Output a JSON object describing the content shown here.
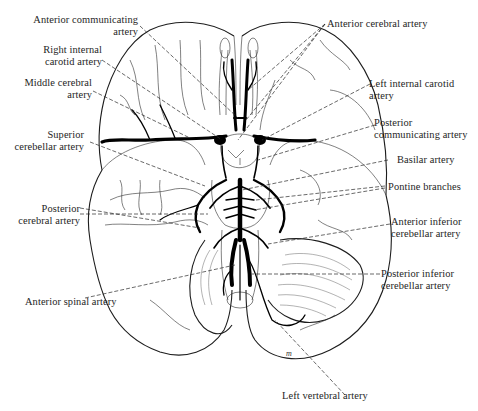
{
  "figure": {
    "artist_mark": "m"
  },
  "labels": {
    "anterior_communicating": {
      "lines": [
        "Anterior communicating",
        "artery"
      ],
      "side": "left"
    },
    "right_internal_carotid": {
      "lines": [
        "Right internal",
        "carotid artery"
      ],
      "side": "left"
    },
    "middle_cerebral": {
      "lines": [
        "Middle cerebral",
        "artery"
      ],
      "side": "left"
    },
    "superior_cerebellar": {
      "lines": [
        "Superior",
        "cerebellar artery"
      ],
      "side": "left"
    },
    "posterior_cerebral": {
      "lines": [
        "Posterior",
        "cerebral artery"
      ],
      "side": "left"
    },
    "anterior_spinal": {
      "lines": [
        "Anterior spinal artery"
      ],
      "side": "left"
    },
    "anterior_cerebral": {
      "lines": [
        "Anterior cerebral artery"
      ],
      "side": "right"
    },
    "left_internal_carotid": {
      "lines": [
        "Left internal carotid",
        "artery"
      ],
      "side": "right"
    },
    "posterior_communicating": {
      "lines": [
        "Posterior",
        "communicating artery"
      ],
      "side": "right"
    },
    "basilar": {
      "lines": [
        "Basilar artery"
      ],
      "side": "right"
    },
    "pontine_branches": {
      "lines": [
        "Pontine branches"
      ],
      "side": "right"
    },
    "anterior_inferior_cerebellar": {
      "lines": [
        "Anterior inferior",
        "cerebellar artery"
      ],
      "side": "right"
    },
    "posterior_inferior_cerebellar": {
      "lines": [
        "Posterior inferior",
        "cerebellar artery"
      ],
      "side": "right"
    },
    "left_vertebral": {
      "lines": [
        "Left vertebral artery"
      ],
      "side": "bottom"
    }
  },
  "colors": {
    "ink": "#1a1a1a",
    "background": "#ffffff"
  }
}
